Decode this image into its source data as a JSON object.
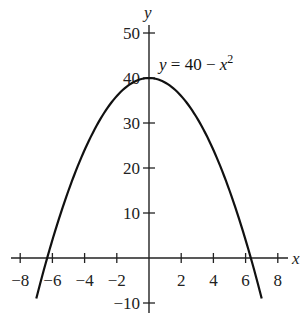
{
  "chart_data": {
    "type": "line",
    "title": "",
    "function": "y = 40 - x^2",
    "annotation": {
      "text_parts": [
        "y",
        " = 40 − ",
        "x",
        "2"
      ],
      "plain": "y = 40 − x²"
    },
    "xlabel": "x",
    "ylabel": "y",
    "xlim": [
      -8,
      8
    ],
    "ylim": [
      -10,
      50
    ],
    "x_ticks": [
      -8,
      -6,
      -4,
      -2,
      2,
      4,
      6,
      8
    ],
    "x_tick_labels": [
      "−8",
      "−6",
      "−4",
      "−2",
      "2",
      "4",
      "6",
      "8"
    ],
    "y_ticks": [
      -10,
      10,
      20,
      30,
      40,
      50
    ],
    "y_tick_labels": [
      "−10",
      "10",
      "20",
      "30",
      "40",
      "50"
    ],
    "grid": false,
    "legend": null,
    "series": [
      {
        "name": "y = 40 - x^2",
        "x": [
          -7,
          -6.5,
          -6,
          -5,
          -4,
          -3,
          -2,
          -1,
          0,
          1,
          2,
          3,
          4,
          5,
          6,
          6.5,
          7
        ],
        "y": [
          -9,
          -2.25,
          4,
          15,
          24,
          31,
          36,
          39,
          40,
          39,
          36,
          31,
          24,
          15,
          4,
          -2.25,
          -9
        ]
      }
    ],
    "x_intercepts": [
      -6.32,
      6.32
    ],
    "vertex": [
      0,
      40
    ],
    "curve_domain": [
      -7,
      7
    ]
  },
  "colors": {
    "axis": "#222222",
    "curve": "#111111",
    "background": "#ffffff"
  }
}
